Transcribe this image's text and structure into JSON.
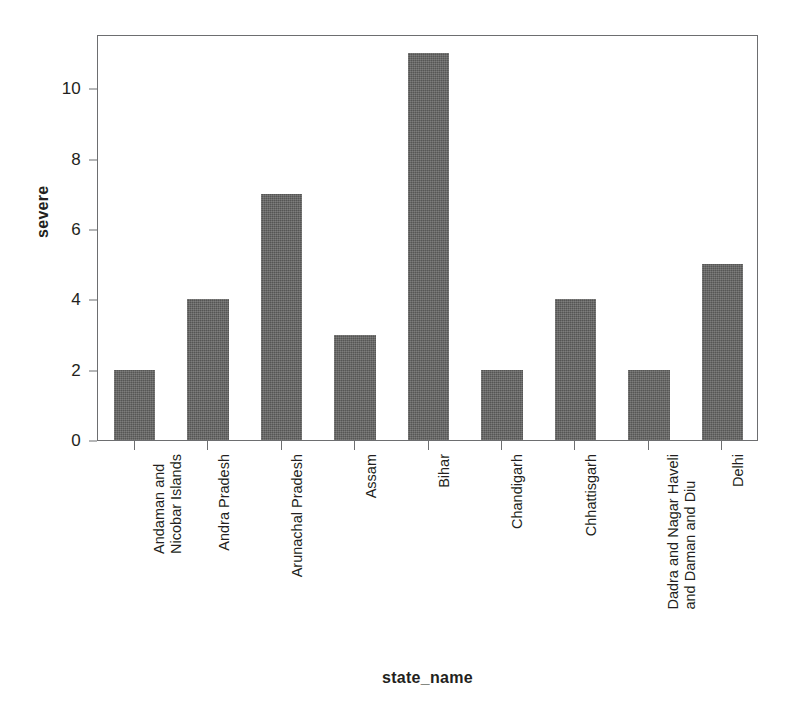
{
  "chart_data": {
    "type": "bar",
    "title": "",
    "xlabel": "state_name",
    "ylabel": "severe",
    "categories": [
      "Andaman and Nicobar Islands",
      "Andra Pradesh",
      "Arunachal Pradesh",
      "Assam",
      "Bihar",
      "Chandigarh",
      "Chhattisgarh",
      "Dadra and Nagar Haveli and Daman and Diu",
      "Delhi"
    ],
    "category_lines": [
      [
        "Andaman and",
        "Nicobar Islands"
      ],
      [
        "Andra Pradesh",
        ""
      ],
      [
        "Arunachal Pradesh",
        ""
      ],
      [
        "Assam",
        ""
      ],
      [
        "Bihar",
        ""
      ],
      [
        "Chandigarh",
        ""
      ],
      [
        "Chhattisgarh",
        ""
      ],
      [
        "Dadra and Nagar Haveli",
        "and Daman and Diu"
      ],
      [
        "Delhi",
        ""
      ]
    ],
    "values": [
      2,
      4,
      7,
      3,
      11,
      2,
      4,
      2,
      5
    ],
    "ylim": [
      0,
      11.55
    ],
    "yticks": [
      0,
      2,
      4,
      6,
      8,
      10
    ],
    "ytick_labels": [
      "0",
      "2",
      "4",
      "6",
      "8",
      "10"
    ],
    "grid": false,
    "legend": false,
    "bar_color": "#60605f",
    "axis_color": "#6d6e70",
    "text_color": "#231f20",
    "background": "#ffffff"
  }
}
